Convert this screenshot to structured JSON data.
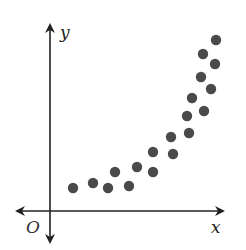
{
  "chart_data": {
    "type": "scatter",
    "title": "",
    "xlabel": "x",
    "ylabel": "y",
    "origin_label": "O",
    "grid": false,
    "legend": null,
    "ticks": {
      "x": [],
      "y": []
    },
    "marker_color": "#4a4a4a",
    "axis_color": "#222222",
    "points_pixel": [
      [
        73,
        188
      ],
      [
        93,
        183
      ],
      [
        108,
        188
      ],
      [
        115,
        172
      ],
      [
        129,
        186
      ],
      [
        137,
        167
      ],
      [
        153,
        172
      ],
      [
        153,
        152
      ],
      [
        173,
        154
      ],
      [
        171,
        137
      ],
      [
        189,
        133
      ],
      [
        187,
        116
      ],
      [
        204,
        111
      ],
      [
        192,
        98
      ],
      [
        211,
        89
      ],
      [
        201,
        77
      ],
      [
        215,
        64
      ],
      [
        203,
        54
      ],
      [
        216,
        40
      ]
    ],
    "points_relative": [
      {
        "x": 0.14,
        "y": 0.1
      },
      {
        "x": 0.25,
        "y": 0.13
      },
      {
        "x": 0.34,
        "y": 0.1
      },
      {
        "x": 0.37,
        "y": 0.21
      },
      {
        "x": 0.45,
        "y": 0.12
      },
      {
        "x": 0.5,
        "y": 0.24
      },
      {
        "x": 0.59,
        "y": 0.21
      },
      {
        "x": 0.59,
        "y": 0.32
      },
      {
        "x": 0.7,
        "y": 0.31
      },
      {
        "x": 0.69,
        "y": 0.4
      },
      {
        "x": 0.79,
        "y": 0.43
      },
      {
        "x": 0.78,
        "y": 0.53
      },
      {
        "x": 0.88,
        "y": 0.56
      },
      {
        "x": 0.81,
        "y": 0.63
      },
      {
        "x": 0.92,
        "y": 0.68
      },
      {
        "x": 0.86,
        "y": 0.75
      },
      {
        "x": 0.94,
        "y": 0.82
      },
      {
        "x": 0.87,
        "y": 0.88
      },
      {
        "x": 0.95,
        "y": 0.96
      }
    ]
  },
  "labels": {
    "x": "x",
    "y": "y",
    "origin": "O"
  }
}
